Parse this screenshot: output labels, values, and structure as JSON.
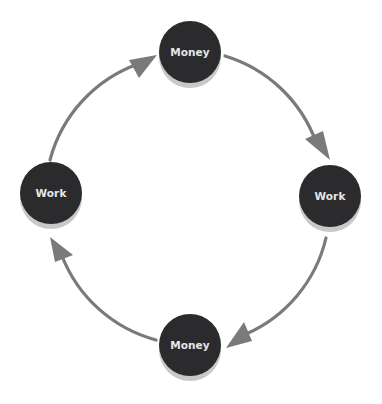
{
  "diagram": {
    "type": "cycle",
    "direction": "clockwise",
    "colors": {
      "node_fill": "#2b2b2d",
      "node_shadow": "#c8c8c8",
      "label": "#e6e6e6",
      "arrow": "#7a7a7a",
      "background": "#ffffff"
    },
    "nodes": [
      {
        "id": "top",
        "label": "Money"
      },
      {
        "id": "right",
        "label": "Work"
      },
      {
        "id": "bottom",
        "label": "Money"
      },
      {
        "id": "left",
        "label": "Work"
      }
    ],
    "edges": [
      {
        "from": "top",
        "to": "right"
      },
      {
        "from": "right",
        "to": "bottom"
      },
      {
        "from": "bottom",
        "to": "left"
      },
      {
        "from": "left",
        "to": "top"
      }
    ]
  }
}
